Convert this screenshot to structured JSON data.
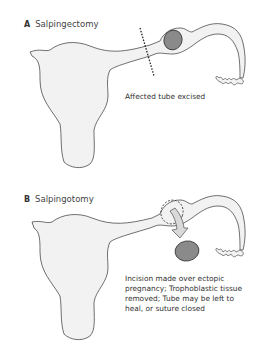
{
  "panels": [
    {
      "letter": "A",
      "title": "Salpingectomy",
      "caption": "Affected tube excised"
    },
    {
      "letter": "B",
      "title": "Salpingotomy",
      "caption_lines": [
        "Incision made over ectopic",
        "pregnancy; Trophoblastic tissue",
        "removed; Tube may be left to",
        "heal, or suture closed"
      ]
    }
  ],
  "colors": {
    "organ_fill": "#f2f2f2",
    "outline": "#333333",
    "ectopic_fill": "#8a8a8a",
    "arrow_fill": "#d9d9d9"
  }
}
